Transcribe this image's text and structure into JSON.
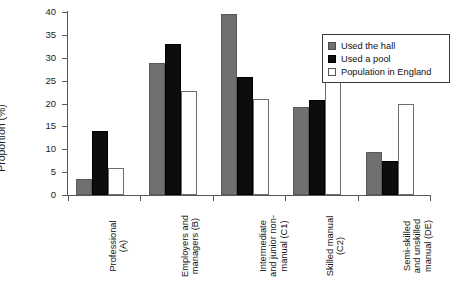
{
  "chart_data": {
    "type": "bar",
    "title": "",
    "xlabel": "",
    "ylabel": "Proportion (%)",
    "ylim": [
      0,
      40
    ],
    "ytick_step": 5,
    "yticks": [
      0,
      5,
      10,
      15,
      20,
      25,
      30,
      35,
      40
    ],
    "grid": false,
    "legend_position": "top-right",
    "categories": [
      "Professional\n(A)",
      "Employers and\nmanagers (B)",
      "Intermediate\nand junior non-\nmanual (C1)",
      "Skilled manual\n(C2)",
      "Semi-skilled\nand unskilled\nmanual (DE)"
    ],
    "series": [
      {
        "name": "Used the hall",
        "color": "#707070",
        "values": [
          3.5,
          28.8,
          39.5,
          19.3,
          9.4
        ]
      },
      {
        "name": "Used a pool",
        "color": "#0d0d0d",
        "values": [
          14.0,
          32.9,
          25.7,
          20.8,
          7.4
        ]
      },
      {
        "name": "Population in England",
        "color": "#ffffff",
        "values": [
          6.0,
          22.7,
          21.0,
          31.3,
          19.9
        ]
      }
    ]
  },
  "legend": {
    "items": [
      {
        "label": "Used the hall"
      },
      {
        "label": "Used a pool"
      },
      {
        "label": "Population in England"
      }
    ]
  },
  "axes": {
    "y_title": "Proportion (%)"
  }
}
